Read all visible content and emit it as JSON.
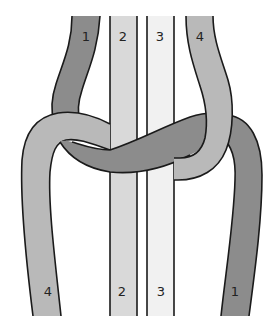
{
  "diagram": {
    "colors": {
      "strand_1": "#8c8c8c",
      "strand_2": "#d9d9d9",
      "strand_3": "#f1f1f1",
      "strand_4": "#b9b9b9",
      "outline": "#1a1a1a",
      "background": "#ffffff"
    },
    "top_labels": [
      {
        "strand": "1",
        "text": "1"
      },
      {
        "strand": "2",
        "text": "2"
      },
      {
        "strand": "3",
        "text": "3"
      },
      {
        "strand": "4",
        "text": "4"
      }
    ],
    "bottom_labels": [
      {
        "strand": "4",
        "text": "4"
      },
      {
        "strand": "2",
        "text": "2"
      },
      {
        "strand": "3",
        "text": "3"
      },
      {
        "strand": "1",
        "text": "1"
      }
    ]
  }
}
